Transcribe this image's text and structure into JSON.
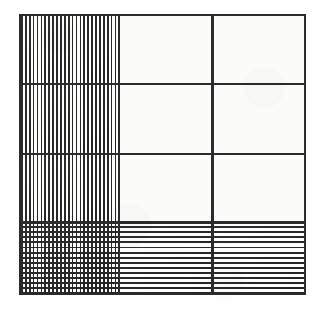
{
  "figure": {
    "colors": {
      "ink": "#2b2b2b",
      "hatch": "#232323",
      "paper": "#fbfbf9",
      "page_background": "#ffffff"
    },
    "frame": {
      "border_width_px": 2.2,
      "left_px": 19,
      "top_px": 14,
      "width_px": 287,
      "height_px": 281
    },
    "columns": [
      {
        "id": "col-1",
        "label": "Column 1",
        "width_pct": 34.2
      },
      {
        "id": "col-2",
        "label": "Column 2",
        "width_pct": 33.1
      },
      {
        "id": "col-3",
        "label": "Column 3",
        "width_pct": 32.7
      }
    ],
    "rows": [
      {
        "id": "row-1",
        "label": "Row 1",
        "top_pct": 0.0,
        "height_pct": 24.2
      },
      {
        "id": "row-2",
        "label": "Row 2",
        "top_pct": 24.2,
        "height_pct": 25.3
      },
      {
        "id": "row-3",
        "label": "Row 3",
        "top_pct": 49.5,
        "height_pct": 24.6
      },
      {
        "id": "row-4",
        "label": "Row 4",
        "top_pct": 74.1,
        "height_pct": 25.9
      }
    ],
    "cells": [
      {
        "id": "cell-r1c1",
        "row": 1,
        "column": 1,
        "fill": "vertical-stripes",
        "fill_class": "fill-vertical"
      },
      {
        "id": "cell-r1c2",
        "row": 1,
        "column": 2,
        "fill": "none",
        "fill_class": "fill-plain"
      },
      {
        "id": "cell-r1c3",
        "row": 1,
        "column": 3,
        "fill": "none",
        "fill_class": "fill-plain"
      },
      {
        "id": "cell-r2c1",
        "row": 2,
        "column": 1,
        "fill": "vertical-stripes",
        "fill_class": "fill-vertical"
      },
      {
        "id": "cell-r2c2",
        "row": 2,
        "column": 2,
        "fill": "none",
        "fill_class": "fill-plain"
      },
      {
        "id": "cell-r2c3",
        "row": 2,
        "column": 3,
        "fill": "none",
        "fill_class": "fill-plain"
      },
      {
        "id": "cell-r3c1",
        "row": 3,
        "column": 1,
        "fill": "vertical-stripes",
        "fill_class": "fill-vertical"
      },
      {
        "id": "cell-r3c2",
        "row": 3,
        "column": 2,
        "fill": "none",
        "fill_class": "fill-plain"
      },
      {
        "id": "cell-r3c3",
        "row": 3,
        "column": 3,
        "fill": "none",
        "fill_class": "fill-plain"
      },
      {
        "id": "cell-r4c1",
        "row": 4,
        "column": 1,
        "fill": "cross-hatch",
        "fill_class": "fill-crosshatch"
      },
      {
        "id": "cell-r4c2",
        "row": 4,
        "column": 2,
        "fill": "horizontal-stripes",
        "fill_class": "fill-horizontal"
      },
      {
        "id": "cell-r4c3",
        "row": 4,
        "column": 3,
        "fill": "horizontal-stripes",
        "fill_class": "fill-horizontal"
      }
    ],
    "hatch_spacing": {
      "vertical_pitch_px": 3.9,
      "horizontal_pitch_px": 5.1,
      "line_weight_px": 1.8
    },
    "dividers": {
      "vertical": [
        {
          "id": "v-divider-1",
          "left_pct": 34.2
        },
        {
          "id": "v-divider-2",
          "left_pct": 67.3
        }
      ],
      "horizontal": [
        {
          "id": "h-divider-1",
          "top_pct": 24.2,
          "weight": "normal"
        },
        {
          "id": "h-divider-2",
          "top_pct": 49.5,
          "weight": "normal"
        },
        {
          "id": "h-divider-3",
          "top_pct": 74.1,
          "weight": "thick"
        }
      ]
    }
  }
}
